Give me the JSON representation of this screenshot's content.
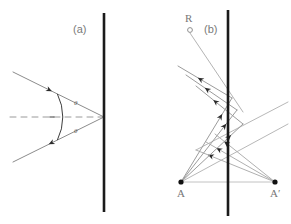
{
  "figure": {
    "background_color": "#ffffff",
    "width": 291,
    "height": 224,
    "panels": [
      {
        "id": "a",
        "label": "(a)",
        "label_x": 73,
        "label_y": 33,
        "description": "Two rays converging on a vertical mirror line with equal angles marked by an arc about the horizontal dashed normal",
        "mirror": {
          "name": "vertical-mirror-line",
          "x": 104,
          "y_top": 13,
          "y_bottom": 212,
          "color": "#1a1a1a",
          "width": 2.6
        },
        "normal": {
          "name": "dashed-normal-line",
          "x1": 10,
          "y1": 117,
          "x2": 104,
          "y2": 117,
          "color": "#9a9a9a",
          "dash": "6,5"
        },
        "vertex": {
          "x": 104,
          "y": 117
        },
        "rays": [
          {
            "name": "upper-incident-ray",
            "x1": 13,
            "y1": 72,
            "x2": 104,
            "y2": 117,
            "arrow_t": 0.42,
            "color": "#8c8c8c"
          },
          {
            "name": "lower-reflected-ray",
            "x1": 104,
            "y1": 117,
            "x2": 13,
            "y2": 162,
            "arrow_t": 0.6,
            "color": "#8c8c8c"
          }
        ],
        "angle_arc": {
          "name": "angle-arc",
          "center_x": 104,
          "center_y": 117,
          "radius": 52,
          "color": "#3d3d3d"
        },
        "angle_labels": [
          {
            "name": "angle-label-upper",
            "text": "θ",
            "x": 74,
            "y": 105
          },
          {
            "name": "angle-label-lower",
            "text": "θ",
            "x": 74,
            "y": 133
          }
        ]
      },
      {
        "id": "b",
        "label": "(b)",
        "label_x": 204,
        "label_y": 33,
        "description": "Point source R and object point A with its mirror image A-prime; a fan of rays from A reflects off the vertical mirror and appears to come from A-prime",
        "mirror": {
          "name": "vertical-mirror-line",
          "x": 228,
          "y_top": 10,
          "y_bottom": 216,
          "color": "#1a1a1a",
          "width": 2.6
        },
        "baseline": {
          "name": "baseline-A-to-Aprime",
          "x1": 181,
          "y1": 182,
          "x2": 275,
          "y2": 182,
          "color": "#c2c2c2"
        },
        "points": [
          {
            "name": "point-R",
            "label": "R",
            "x": 190,
            "y": 30,
            "marker": "open-circle",
            "label_x": 185,
            "label_y": 22
          },
          {
            "name": "point-A",
            "label": "A",
            "x": 181,
            "y": 182,
            "marker": "filled-dot",
            "label_x": 177,
            "label_y": 197
          },
          {
            "name": "point-A-prime",
            "label": "A′",
            "x": 275,
            "y": 182,
            "marker": "filled-dot",
            "label_x": 270,
            "label_y": 197
          }
        ],
        "ray_from_source": {
          "name": "ray-from-R",
          "x1": 190,
          "y1": 33,
          "x2": 243,
          "y2": 112,
          "color": "#b4b4b4"
        },
        "incident_rays": [
          {
            "name": "incident-ray-1",
            "x1": 181,
            "y1": 182,
            "x2": 232,
            "y2": 98,
            "arrow_t": 0.8,
            "color": "#9c9c9c"
          },
          {
            "name": "incident-ray-2",
            "x1": 181,
            "y1": 182,
            "x2": 237,
            "y2": 110,
            "arrow_t": 0.8,
            "color": "#9c9c9c"
          },
          {
            "name": "incident-ray-3",
            "x1": 181,
            "y1": 182,
            "x2": 243,
            "y2": 124,
            "arrow_t": 0.8,
            "color": "#9c9c9c"
          }
        ],
        "reflected_rays": [
          {
            "name": "reflected-ray-1",
            "x1": 232,
            "y1": 98,
            "x2": 178,
            "y2": 66,
            "arrow_t": 0.62,
            "color": "#9c9c9c"
          },
          {
            "name": "reflected-ray-2",
            "x1": 237,
            "y1": 110,
            "x2": 186,
            "y2": 75,
            "arrow_t": 0.62,
            "color": "#9c9c9c"
          },
          {
            "name": "reflected-ray-3",
            "x1": 243,
            "y1": 124,
            "x2": 196,
            "y2": 86,
            "arrow_t": 0.62,
            "color": "#9c9c9c"
          }
        ],
        "virtual_rays": [
          {
            "name": "virtual-ray-1",
            "x1": 275,
            "y1": 182,
            "x2": 215,
            "y2": 134,
            "arrow_t": 0.84,
            "color": "#b0b0b0"
          },
          {
            "name": "virtual-ray-2",
            "x1": 275,
            "y1": 182,
            "x2": 206,
            "y2": 142,
            "arrow_t": 0.84,
            "color": "#b0b0b0"
          },
          {
            "name": "virtual-ray-3",
            "x1": 275,
            "y1": 182,
            "x2": 196,
            "y2": 150,
            "arrow_t": 0.84,
            "color": "#b0b0b0"
          }
        ],
        "crossing_rays": [
          {
            "name": "crossing-ray-right-1",
            "x1": 181,
            "y1": 182,
            "x2": 288,
            "y2": 124,
            "arrow_t": 0.0,
            "color": "#b8b8b8"
          },
          {
            "name": "crossing-ray-right-2",
            "x1": 196,
            "y1": 150,
            "x2": 288,
            "y2": 102,
            "arrow_t": 0.0,
            "color": "#b8b8b8"
          }
        ]
      }
    ]
  }
}
